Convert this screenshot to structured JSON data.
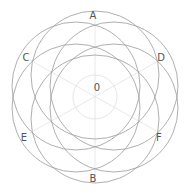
{
  "diagram": {
    "center": {
      "x": 95,
      "y": 97
    },
    "center_label": "0",
    "inner_circle_radius": 22,
    "circle_radius": 64,
    "circle_offset": 22,
    "stroke_color": "#9a9a9a",
    "faint_color": "#e2e2e2",
    "labels": [
      {
        "id": "A",
        "text": "A",
        "x": 93,
        "y": 19
      },
      {
        "id": "B",
        "text": "B",
        "x": 93,
        "y": 182
      },
      {
        "id": "C",
        "text": "C",
        "x": 26,
        "y": 61
      },
      {
        "id": "D",
        "text": "D",
        "x": 161,
        "y": 61
      },
      {
        "id": "E",
        "text": "E",
        "x": 24,
        "y": 141
      },
      {
        "id": "F",
        "text": "F",
        "x": 159,
        "y": 141
      }
    ],
    "circles": [
      {
        "name": "circle-A",
        "cx": 95,
        "cy": 75
      },
      {
        "name": "circle-B",
        "cx": 95,
        "cy": 119
      },
      {
        "name": "circle-C",
        "cx": 76,
        "cy": 86
      },
      {
        "name": "circle-D",
        "cx": 114,
        "cy": 86
      },
      {
        "name": "circle-E",
        "cx": 76,
        "cy": 108
      },
      {
        "name": "circle-F",
        "cx": 114,
        "cy": 108
      }
    ]
  }
}
